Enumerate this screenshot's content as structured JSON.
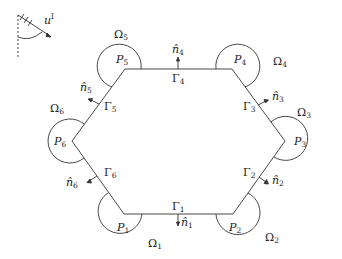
{
  "diagram": {
    "type": "hexagonal domain with corner subdomains",
    "incident_wave": {
      "label": "u",
      "superscript": "I"
    },
    "vertices": [
      {
        "id": "P1",
        "label": "P",
        "sub": "1",
        "x": 124,
        "y": 214
      },
      {
        "id": "P2",
        "label": "P",
        "sub": "2",
        "x": 233,
        "y": 214
      },
      {
        "id": "P3",
        "label": "P",
        "sub": "3",
        "x": 285,
        "y": 141
      },
      {
        "id": "P4",
        "label": "P",
        "sub": "4",
        "x": 232,
        "y": 69
      },
      {
        "id": "P5",
        "label": "P",
        "sub": "5",
        "x": 125,
        "y": 69
      },
      {
        "id": "P6",
        "label": "P",
        "sub": "6",
        "x": 72,
        "y": 141
      }
    ],
    "edges": [
      {
        "id": "Gamma1",
        "label": "Γ",
        "sub": "1",
        "normal": "n̂",
        "normal_sub": "1"
      },
      {
        "id": "Gamma2",
        "label": "Γ",
        "sub": "2",
        "normal": "n̂",
        "normal_sub": "2"
      },
      {
        "id": "Gamma3",
        "label": "Γ",
        "sub": "3",
        "normal": "n̂",
        "normal_sub": "3"
      },
      {
        "id": "Gamma4",
        "label": "Γ",
        "sub": "4",
        "normal": "n̂",
        "normal_sub": "4"
      },
      {
        "id": "Gamma5",
        "label": "Γ",
        "sub": "5",
        "normal": "n̂",
        "normal_sub": "5"
      },
      {
        "id": "Gamma6",
        "label": "Γ",
        "sub": "6",
        "normal": "n̂",
        "normal_sub": "6"
      }
    ],
    "regions": [
      {
        "id": "Omega1",
        "label": "Ω",
        "sub": "1"
      },
      {
        "id": "Omega2",
        "label": "Ω",
        "sub": "2"
      },
      {
        "id": "Omega3",
        "label": "Ω",
        "sub": "3"
      },
      {
        "id": "Omega4",
        "label": "Ω",
        "sub": "4"
      },
      {
        "id": "Omega5",
        "label": "Ω",
        "sub": "5"
      },
      {
        "id": "Omega6",
        "label": "Ω",
        "sub": "6"
      }
    ],
    "colors": {
      "stroke": "#333333",
      "text": "#222222",
      "background": "#ffffff"
    }
  }
}
